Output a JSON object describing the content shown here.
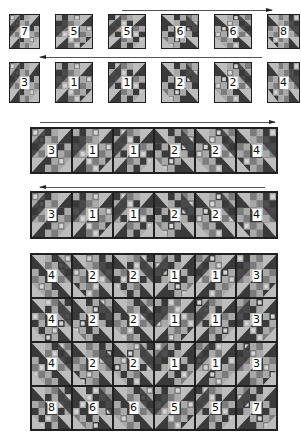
{
  "colors": {
    "dark": "#3a3a3a",
    "medium": "#7c7c7c",
    "light": "#bdbdbd",
    "print": "#a9a9a9",
    "border": "#1f1f1f",
    "arrow": "#444444"
  },
  "steps": [
    {
      "id": "row1-blocks",
      "arrow_direction": "right",
      "layout": "separate-blocks",
      "orientation": "A",
      "labels": [
        "7",
        "5",
        "5",
        "6",
        "6",
        "8"
      ]
    },
    {
      "id": "row2-blocks",
      "arrow_direction": "left",
      "layout": "separate-blocks",
      "orientation": "B",
      "labels": [
        "3",
        "1",
        "1",
        "2",
        "2",
        "4"
      ]
    },
    {
      "id": "strip-1",
      "arrow_direction": "right",
      "layout": "joined-strip",
      "labels": [
        "3",
        "1",
        "1",
        "2",
        "2",
        "4"
      ]
    },
    {
      "id": "strip-2",
      "arrow_direction": "left",
      "layout": "joined-strip",
      "labels": [
        "3",
        "1",
        "1",
        "2",
        "2",
        "4"
      ]
    },
    {
      "id": "quilt-top",
      "layout": "assembled-quilt",
      "rows": [
        [
          "4",
          "2",
          "2",
          "1",
          "1",
          "3"
        ],
        [
          "4",
          "2",
          "2",
          "1",
          "1",
          "3"
        ],
        [
          "4",
          "2",
          "2",
          "1",
          "1",
          "3"
        ],
        [
          "8",
          "6",
          "6",
          "5",
          "5",
          "7"
        ]
      ]
    }
  ]
}
